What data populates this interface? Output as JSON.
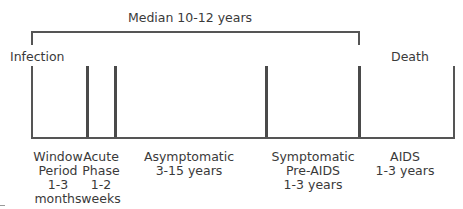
{
  "diagram": {
    "title": "Median 10-12 years",
    "start_label": "Infection",
    "end_label": "Death",
    "colors": {
      "line": "#555555",
      "text": "#3a3a3a",
      "background": "#ffffff"
    },
    "phases": [
      {
        "name": "Window Period",
        "lines": [
          "Window",
          "Period",
          "1-3",
          "months"
        ]
      },
      {
        "name": "Acute Phase",
        "lines": [
          "Acute",
          "Phase",
          "1-2",
          "weeks"
        ]
      },
      {
        "name": "Asymptomatic",
        "lines": [
          "Asymptomatic",
          "3-15 years"
        ]
      },
      {
        "name": "Symptomatic Pre-AIDS",
        "lines": [
          "Symptomatic",
          "Pre-AIDS",
          "1-3 years"
        ]
      },
      {
        "name": "AIDS",
        "lines": [
          "AIDS",
          "1-3 years"
        ]
      }
    ]
  }
}
